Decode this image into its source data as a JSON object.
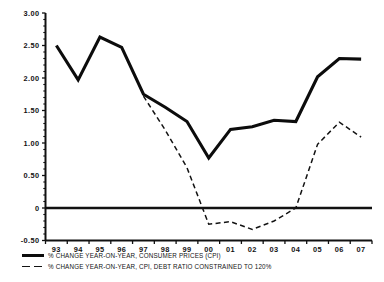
{
  "chart_data": {
    "type": "line",
    "title": "",
    "subtitle": "",
    "xlabel": "",
    "ylabel": "",
    "categories": [
      "93",
      "94",
      "95",
      "96",
      "97",
      "98",
      "99",
      "00",
      "01",
      "02",
      "03",
      "04",
      "05",
      "06",
      "07"
    ],
    "ylim": [
      -0.5,
      3.0
    ],
    "yticks": [
      "3.00",
      "2.50",
      "2.00",
      "1.50",
      "1.00",
      "0.50",
      "0",
      "-0.50"
    ],
    "ytick_values": [
      3.0,
      2.5,
      2.0,
      1.5,
      1.0,
      0.5,
      0,
      -0.5
    ],
    "grid": false,
    "legend_position": "below",
    "zero_line": 0,
    "series": [
      {
        "name": "% CHANGE YEAR-ON-YEAR, CONSUMER PRICES (CPI)",
        "style": "solid",
        "color": "#0c0c0c",
        "x": [
          "93",
          "94",
          "95",
          "96",
          "97",
          "98",
          "99",
          "00",
          "01",
          "02",
          "03",
          "04",
          "05",
          "06",
          "07"
        ],
        "values": [
          2.5,
          1.97,
          2.63,
          2.47,
          1.75,
          1.55,
          1.33,
          0.77,
          1.21,
          1.25,
          1.35,
          1.33,
          2.02,
          2.3,
          2.29
        ]
      },
      {
        "name": "% CHANGE YEAR-ON-YEAR, CPI, DEBT RATIO CONSTRAINED TO 120%",
        "style": "dashed",
        "color": "#131313",
        "x": [
          "97",
          "98",
          "99",
          "00",
          "01",
          "02",
          "03",
          "04",
          "05",
          "06",
          "07"
        ],
        "values": [
          1.72,
          1.2,
          0.62,
          -0.25,
          -0.21,
          -0.33,
          -0.2,
          0.0,
          0.98,
          1.32,
          1.09
        ]
      }
    ]
  },
  "legend": {
    "items": [
      {
        "label": "% CHANGE YEAR-ON-YEAR, CONSUMER PRICES (CPI)",
        "style": "solid"
      },
      {
        "label": "% CHANGE YEAR-ON-YEAR, CPI, DEBT RATIO CONSTRAINED TO 120%",
        "style": "dashed"
      }
    ]
  }
}
